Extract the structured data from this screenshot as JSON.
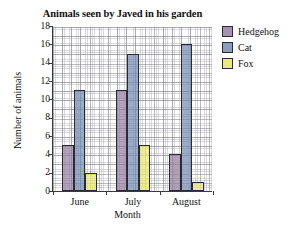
{
  "chart_data": {
    "type": "bar",
    "title": "Animals seen by Javed in his garden",
    "xlabel": "Month",
    "ylabel": "Number of animals",
    "categories": [
      "June",
      "July",
      "August"
    ],
    "series": [
      {
        "name": "Hedgehog",
        "color": "#967ea2",
        "values": [
          5,
          11,
          4
        ]
      },
      {
        "name": "Cat",
        "color": "#748cb4",
        "values": [
          11,
          15,
          16
        ]
      },
      {
        "name": "Fox",
        "color": "#e9e96e",
        "values": [
          2,
          5,
          1
        ]
      }
    ],
    "ylim": [
      0,
      18
    ],
    "ytick_step": 2,
    "yticks": [
      0,
      2,
      4,
      6,
      8,
      10,
      12,
      14,
      16,
      18
    ],
    "ytick_labels": [
      "0",
      "2",
      "4",
      "6",
      "8",
      "10",
      "12",
      "14",
      "16",
      "18"
    ],
    "grid": true,
    "grid_style": "graph-paper",
    "legend_position": "right",
    "bar_outline_color": "#2a2a33"
  },
  "legend": {
    "entries": [
      {
        "label": "Hedgehog",
        "swatch": "#967ea2"
      },
      {
        "label": "Cat",
        "swatch": "#748cb4"
      },
      {
        "label": "Fox",
        "swatch": "#e9e96e"
      }
    ]
  }
}
